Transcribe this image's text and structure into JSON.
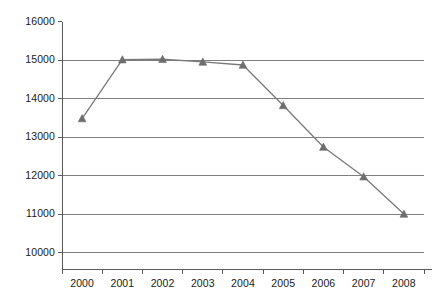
{
  "chart_data": {
    "type": "line",
    "title": "",
    "subtitle": "",
    "xlabel": "",
    "ylabel": "",
    "categories": [
      "2000",
      "2001",
      "2002",
      "2003",
      "2004",
      "2005",
      "2006",
      "2007",
      "2008"
    ],
    "values": [
      13480,
      15010,
      15020,
      14950,
      14870,
      13820,
      12740,
      11970,
      11000
    ],
    "series": [
      {
        "name": "",
        "values": [
          13480,
          15010,
          15020,
          14950,
          14870,
          13820,
          12740,
          11970,
          11000
        ]
      }
    ],
    "ylim": [
      10000,
      16000
    ],
    "ytick_labels": [
      "10000",
      "11000",
      "12000",
      "13000",
      "14000",
      "15000",
      "16000"
    ],
    "ytick_values": [
      10000,
      11000,
      12000,
      13000,
      14000,
      15000,
      16000
    ],
    "xtick_labels": [
      "2000",
      "2001",
      "2002",
      "2003",
      "2004",
      "2005",
      "2006",
      "2007",
      "2008"
    ],
    "grid": {
      "horizontal": true,
      "vertical": false
    },
    "legend": {
      "visible": false,
      "position": "none",
      "entries": []
    },
    "marker": "triangle",
    "annotations": [],
    "colors": {
      "line": "#7a7a7a",
      "marker": "#6e6e6e",
      "gridline": "#7f7f7f",
      "axis": "#5a5a5a",
      "text": "#1a1a1a",
      "background": "#ffffff"
    }
  }
}
